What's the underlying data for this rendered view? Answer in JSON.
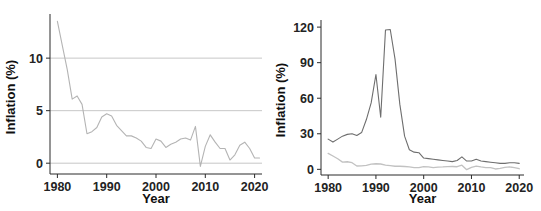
{
  "figure": {
    "background_color": "#ffffff",
    "panel_count": 2
  },
  "chart_data": [
    {
      "type": "line",
      "panel": "left",
      "title": "",
      "xlabel": "Year",
      "ylabel": "Inflation (%)",
      "xlim": [
        1978.5,
        2021.5
      ],
      "ylim": [
        -1.6,
        14.2
      ],
      "xticks": [
        1980,
        1990,
        2000,
        2010,
        2020
      ],
      "xtick_labels": [
        "1980",
        "1990",
        "2000",
        "2010",
        "2020"
      ],
      "yticks": [
        0,
        5,
        10
      ],
      "ytick_labels": [
        "0",
        "5",
        "10"
      ],
      "grid": true,
      "gridlines_y": [
        0,
        5,
        10
      ],
      "grid_color": "#b9b9b9",
      "legend": "none",
      "series": [
        {
          "name": "Advanced economies inflation",
          "color": "#b4b4b4",
          "line_width": 1.1,
          "x": [
            1980,
            1981,
            1982,
            1983,
            1984,
            1985,
            1986,
            1987,
            1988,
            1989,
            1990,
            1991,
            1992,
            1993,
            1994,
            1995,
            1996,
            1997,
            1998,
            1999,
            2000,
            2001,
            2002,
            2003,
            2004,
            2005,
            2006,
            2007,
            2008,
            2009,
            2010,
            2011,
            2012,
            2013,
            2014,
            2015,
            2016,
            2017,
            2018,
            2019,
            2020,
            2021
          ],
          "values": [
            13.5,
            11.2,
            8.9,
            6.1,
            6.4,
            5.6,
            2.8,
            3.0,
            3.4,
            4.4,
            4.7,
            4.5,
            3.6,
            3.1,
            2.6,
            2.6,
            2.4,
            2.1,
            1.5,
            1.4,
            2.3,
            2.1,
            1.5,
            1.8,
            2.0,
            2.3,
            2.4,
            2.2,
            3.5,
            -0.3,
            1.6,
            2.7,
            2.0,
            1.4,
            1.4,
            0.3,
            0.8,
            1.7,
            2.0,
            1.4,
            0.5,
            0.5
          ]
        }
      ]
    },
    {
      "type": "line",
      "panel": "right",
      "title": "",
      "xlabel": "Year",
      "ylabel": "Inflation (%)",
      "xlim": [
        1978.5,
        2021.0
      ],
      "ylim": [
        -9.0,
        126.0
      ],
      "xticks": [
        1980,
        1990,
        2000,
        2010,
        2020
      ],
      "xtick_labels": [
        "1980",
        "1990",
        "2000",
        "2010",
        "2020"
      ],
      "yticks": [
        0,
        30,
        60,
        90,
        120
      ],
      "ytick_labels": [
        "0",
        "30",
        "60",
        "90",
        "120"
      ],
      "grid": false,
      "legend": "none",
      "series": [
        {
          "name": "Emerging and developing economies inflation",
          "color": "#6e6e6e",
          "line_width": 1.1,
          "x": [
            1980,
            1981,
            1982,
            1983,
            1984,
            1985,
            1986,
            1987,
            1988,
            1989,
            1990,
            1991,
            1992,
            1993,
            1994,
            1995,
            1996,
            1997,
            1998,
            1999,
            2000,
            2001,
            2002,
            2003,
            2004,
            2005,
            2006,
            2007,
            2008,
            2009,
            2010,
            2011,
            2012,
            2013,
            2014,
            2015,
            2016,
            2017,
            2018,
            2019,
            2020
          ],
          "values": [
            25.5,
            23.0,
            25.5,
            28.0,
            29.5,
            30.0,
            28.5,
            31.0,
            42.0,
            56.0,
            80.0,
            44.0,
            117.5,
            118.0,
            93.0,
            55.0,
            28.0,
            16.5,
            14.5,
            14.0,
            9.5,
            9.0,
            8.5,
            8.0,
            7.5,
            7.0,
            6.5,
            7.5,
            10.5,
            7.0,
            7.0,
            8.5,
            7.0,
            6.5,
            6.0,
            5.5,
            5.0,
            5.0,
            5.5,
            5.5,
            5.0
          ]
        },
        {
          "name": "Advanced economies inflation",
          "color": "#c2c2c2",
          "line_width": 1.3,
          "x": [
            1980,
            1981,
            1982,
            1983,
            1984,
            1985,
            1986,
            1987,
            1988,
            1989,
            1990,
            1991,
            1992,
            1993,
            1994,
            1995,
            1996,
            1997,
            1998,
            1999,
            2000,
            2001,
            2002,
            2003,
            2004,
            2005,
            2006,
            2007,
            2008,
            2009,
            2010,
            2011,
            2012,
            2013,
            2014,
            2015,
            2016,
            2017,
            2018,
            2019,
            2020
          ],
          "values": [
            13.5,
            11.2,
            8.9,
            6.1,
            6.4,
            5.6,
            2.8,
            3.0,
            3.4,
            4.4,
            4.7,
            4.5,
            3.6,
            3.1,
            2.6,
            2.6,
            2.4,
            2.1,
            1.5,
            1.4,
            2.3,
            2.1,
            1.5,
            1.8,
            2.0,
            2.3,
            2.4,
            2.2,
            3.5,
            -0.3,
            1.6,
            2.7,
            2.0,
            1.4,
            1.4,
            0.3,
            0.8,
            1.7,
            2.0,
            1.4,
            0.5
          ]
        }
      ]
    }
  ]
}
